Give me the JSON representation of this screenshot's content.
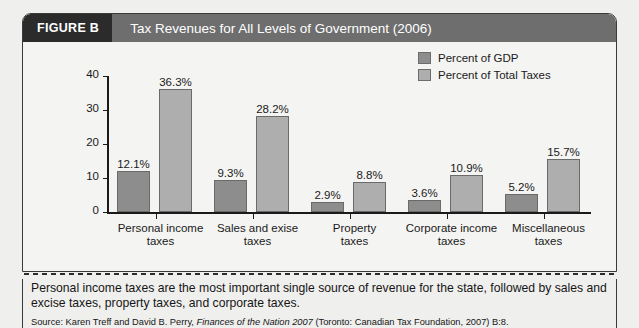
{
  "figure": {
    "tag": "FIGURE B",
    "title": "Tax Revenues for All Levels of Government (2006)"
  },
  "caption": {
    "text": "Personal income taxes are the most important single source of revenue for the state, followed by sales and excise taxes, property taxes, and corporate taxes.",
    "source_prefix": "Source: Karen Treff and David B. Perry, ",
    "source_work": "Finances of the Nation 2007",
    "source_suffix": " (Toronto: Canadian Tax Foundation, 2007) B:8."
  },
  "colors": {
    "header_tag_bg": "#2b2b2b",
    "header_title_bg": "#6e6e6e",
    "series_gdp": "#8d8d8d",
    "series_total": "#aeaeae",
    "card_bg": "#f4f4f2",
    "page_bg": "#efefed"
  },
  "chart_data": {
    "type": "bar",
    "title": "Tax Revenues for All Levels of Government (2006)",
    "xlabel": "",
    "ylabel": "",
    "ylim": [
      0,
      40
    ],
    "yticks": [
      0,
      10,
      20,
      30,
      40
    ],
    "ytick_labels": [
      "0",
      "10",
      "20",
      "30",
      "40"
    ],
    "grid": false,
    "legend_position": "top-right",
    "categories": [
      "Personal income taxes",
      "Sales and exise taxes",
      "Property taxes",
      "Corporate income taxes",
      "Miscellaneous taxes"
    ],
    "category_lines": [
      [
        "Personal income",
        "taxes"
      ],
      [
        "Sales and exise",
        "taxes"
      ],
      [
        "Property",
        "taxes"
      ],
      [
        "Corporate income",
        "taxes"
      ],
      [
        "Miscellaneous",
        "taxes"
      ]
    ],
    "series": [
      {
        "name": "Percent of GDP",
        "color": "#8d8d8d",
        "values": [
          12.1,
          9.3,
          2.9,
          3.6,
          5.2
        ],
        "labels": [
          "12.1%",
          "9.3%",
          "2.9%",
          "3.6%",
          "5.2%"
        ]
      },
      {
        "name": "Percent of Total Taxes",
        "color": "#aeaeae",
        "values": [
          36.3,
          28.2,
          8.8,
          10.9,
          15.7
        ],
        "labels": [
          "36.3%",
          "28.2%",
          "8.8%",
          "10.9%",
          "15.7%"
        ]
      }
    ]
  }
}
